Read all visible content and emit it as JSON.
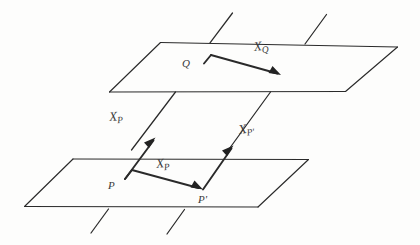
{
  "figure": {
    "ink_color": "#2a2a2a",
    "background_color": "#fdfdfc",
    "labels": {
      "q_point": "Q",
      "p_point": "P",
      "p_prime_point": "P'",
      "x_q_symbol": "X",
      "x_q_subscript": "Q",
      "x_p_symbol": "X",
      "x_p_subscript": "P",
      "x_p_upper_symbol": "X",
      "x_p_upper_subscript": "P",
      "x_p_prime_symbol": "X",
      "x_p_prime_subscript": "P'"
    },
    "elements": {
      "upper_plane_name": "upper-plane",
      "lower_plane_name": "lower-plane",
      "vector_xq_name": "vector-x-q",
      "vector_xp_name": "vector-x-p",
      "vector_xp_upper_name": "vector-x-p-vertical",
      "vector_xp_prime_name": "vector-x-p-prime"
    }
  }
}
